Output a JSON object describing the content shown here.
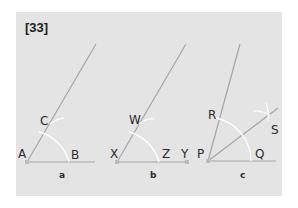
{
  "figure": {
    "number_label": "[33]",
    "colors": {
      "panel": "#e4e4e4",
      "ray": "#9a9a9a",
      "arc": "#ffffff",
      "text": "#2a2a2a"
    },
    "panels": [
      {
        "caption": "a",
        "vertex_label": "A",
        "points": {
          "ray_point": "C",
          "base_point": "B"
        }
      },
      {
        "caption": "b",
        "vertex_label": "X",
        "points": {
          "ray_point": "W",
          "base_arc_point": "Z",
          "base_end": "Y"
        }
      },
      {
        "caption": "c",
        "vertex_label": "P",
        "points": {
          "ray_point": "R",
          "base_point": "Q",
          "bisector_point": "S"
        }
      }
    ]
  }
}
